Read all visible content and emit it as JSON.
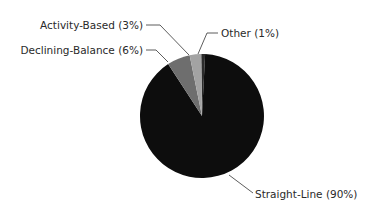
{
  "chart_data": {
    "type": "pie",
    "title": "",
    "categories": [
      "Straight-Line",
      "Declining-Balance",
      "Activity-Based",
      "Other"
    ],
    "values": [
      90,
      6,
      3,
      1
    ],
    "labels": [
      "Straight-Line (90%)",
      "Declining-Balance (6%)",
      "Activity-Based (3%)",
      "Other (1%)"
    ],
    "colors": [
      "#0d0d0d",
      "#6e6e6e",
      "#a3a3a3",
      "#2b2b2b"
    ],
    "legend": "none",
    "label_style": "callout with leader lines"
  }
}
